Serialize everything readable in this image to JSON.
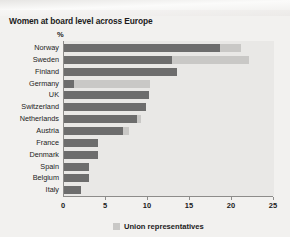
{
  "chart_data": {
    "type": "bar",
    "orientation": "horizontal",
    "title": "Women at board level across Europe",
    "unit_label": "%",
    "xlabel": "",
    "ylabel": "",
    "xlim": [
      0,
      25
    ],
    "xticks": [
      0,
      5,
      10,
      15,
      20,
      25
    ],
    "grid": false,
    "legend_position": "bottom",
    "categories": [
      "Norway",
      "Sweden",
      "Finland",
      "Germany",
      "UK",
      "Switzerland",
      "Netherlands",
      "Austria",
      "France",
      "Denmark",
      "Spain",
      "Belgium",
      "Italy"
    ],
    "series": [
      {
        "name": "Women at board level",
        "color": "#6d6d6d",
        "values": [
          18.6,
          12.8,
          13.4,
          1.2,
          10.1,
          9.8,
          8.7,
          7.0,
          4.1,
          4.0,
          3.0,
          3.0,
          2.0
        ]
      },
      {
        "name": "Union representatives",
        "color": "#c9c8c6",
        "values": [
          2.5,
          9.2,
          0,
          9.0,
          0,
          0,
          0.5,
          0.7,
          0,
          0,
          0,
          0,
          0
        ]
      }
    ],
    "legend": [
      {
        "label": "Union representatives",
        "color": "#c9c8c6"
      }
    ]
  },
  "colors": {
    "bar_main": "#6d6d6d",
    "bar_union": "#c9c8c6",
    "plot_background": "#e9e8e6",
    "page_background": "#f2f1ef",
    "axis": "#8d8c8a",
    "text": "#1b1b1b"
  }
}
